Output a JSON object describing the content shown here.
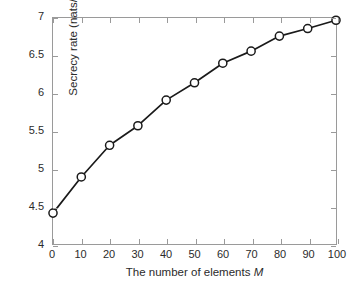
{
  "chart_data": {
    "type": "line",
    "title": "",
    "xlabel_text": "The number of elements ",
    "xlabel_symbol": "M",
    "ylabel": "Secrecy rate (nats/s/Hz)",
    "xlim": [
      0,
      100
    ],
    "ylim": [
      4,
      7
    ],
    "xticks": [
      0,
      10,
      20,
      30,
      40,
      50,
      60,
      70,
      80,
      90,
      100
    ],
    "xtick_labels": [
      "0",
      "10",
      "20",
      "30",
      "40",
      "50",
      "60",
      "70",
      "80",
      "90",
      "100"
    ],
    "yticks": [
      4,
      4.5,
      5,
      5.5,
      6,
      6.5,
      7
    ],
    "ytick_labels": [
      "4",
      "4.5",
      "5",
      "5.5",
      "6",
      "6.5",
      "7"
    ],
    "grid": false,
    "legend": null,
    "marker": "circle-open",
    "line_color": "#1a1a1a",
    "marker_edge_color": "#1a1a1a",
    "marker_face_color": "#ffffff",
    "axis_color": "#9a9a9a",
    "background_color": "#ffffff",
    "x": [
      0,
      10,
      20,
      30,
      40,
      50,
      60,
      70,
      80,
      90,
      100
    ],
    "values": [
      4.41,
      4.89,
      5.31,
      5.57,
      5.91,
      6.14,
      6.4,
      6.56,
      6.76,
      6.86,
      6.97
    ],
    "series": [
      {
        "name": "Secrecy rate",
        "values": [
          4.41,
          4.89,
          5.31,
          5.57,
          5.91,
          6.14,
          6.4,
          6.56,
          6.76,
          6.86,
          6.97
        ]
      }
    ]
  }
}
